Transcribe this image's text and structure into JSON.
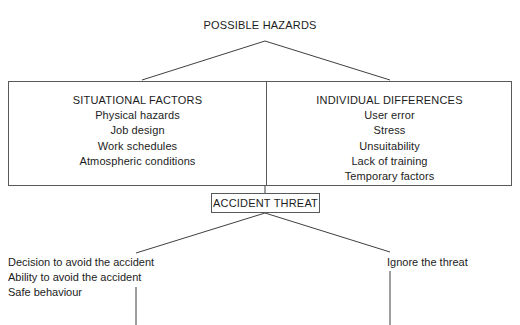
{
  "diagram": {
    "title": "POSSIBLE HAZARDS",
    "root_label": "POSSIBLE HAZARDS",
    "background_color": "#ffffff",
    "line_color": "#58595b",
    "text_color": "#1c1c1c"
  },
  "columns": {
    "situational": {
      "heading": "SITUATIONAL FACTORS",
      "items": [
        "Physical hazards",
        "Job design",
        "Work schedules",
        "Atmospheric conditions"
      ]
    },
    "individual": {
      "heading": "INDIVIDUAL DIFFERENCES",
      "items": [
        "User error",
        "Stress",
        "Unsuitability",
        "Lack of training",
        "Temporary factors"
      ]
    }
  },
  "threat": {
    "label": "ACCIDENT THREAT"
  },
  "outcomes": {
    "left": {
      "lines": [
        "Decision to avoid the accident",
        "Ability to avoid the accident",
        "Safe behaviour"
      ]
    },
    "right": {
      "lines": [
        "Ignore the threat"
      ]
    }
  }
}
